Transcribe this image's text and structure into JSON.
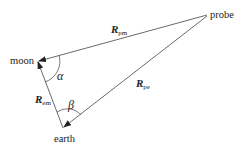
{
  "diagram": {
    "nodes": {
      "moon": {
        "label": "moon",
        "x": 38,
        "y": 61
      },
      "earth": {
        "label": "earth",
        "x": 63,
        "y": 128
      },
      "probe": {
        "label": "probe",
        "x": 208,
        "y": 15
      }
    },
    "vectors": {
      "pm": {
        "symbol": "R",
        "subscript": "pm",
        "from": "probe",
        "to": "moon"
      },
      "pe": {
        "symbol": "R",
        "subscript": "pe",
        "from": "probe",
        "to": "earth"
      },
      "em": {
        "symbol": "R",
        "subscript": "em",
        "from": "earth",
        "to": "moon"
      }
    },
    "angles": {
      "alpha": {
        "symbol": "α",
        "vertex": "moon"
      },
      "beta": {
        "symbol": "β",
        "vertex": "earth"
      }
    },
    "colors": {
      "line": "#333333",
      "text": "#222222",
      "background": "#ffffff"
    }
  }
}
